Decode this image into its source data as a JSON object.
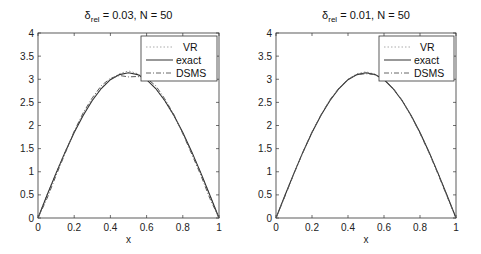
{
  "figure": {
    "panels": [
      {
        "title_symbol": "δ",
        "title_subscript": "rel",
        "title_rest": " = 0.03, N = 50",
        "xlabel": "x"
      },
      {
        "title_symbol": "δ",
        "title_subscript": "rel",
        "title_rest": " = 0.01, N = 50",
        "xlabel": "x"
      }
    ],
    "legend": [
      "VR",
      "exact",
      "DSMS"
    ]
  },
  "chart_data": [
    {
      "type": "line",
      "title": "δ_rel = 0.03, N = 50",
      "xlabel": "x",
      "ylabel": "",
      "xlim": [
        0,
        1
      ],
      "ylim": [
        0,
        4
      ],
      "xticks": [
        0,
        0.2,
        0.4,
        0.6,
        0.8,
        1
      ],
      "yticks": [
        0,
        0.5,
        1,
        1.5,
        2,
        2.5,
        3,
        3.5,
        4
      ],
      "legend_position": "upper right",
      "grid": false,
      "x": [
        0,
        0.05,
        0.1,
        0.15,
        0.2,
        0.25,
        0.3,
        0.35,
        0.4,
        0.45,
        0.5,
        0.55,
        0.6,
        0.65,
        0.7,
        0.75,
        0.8,
        0.85,
        0.9,
        0.95,
        1
      ],
      "series": [
        {
          "name": "VR",
          "style": "dotted",
          "values": [
            0,
            0.5,
            0.98,
            1.44,
            1.86,
            2.24,
            2.56,
            2.82,
            3.0,
            3.12,
            3.18,
            3.12,
            2.99,
            2.8,
            2.53,
            2.21,
            1.84,
            1.42,
            0.97,
            0.49,
            0
          ]
        },
        {
          "name": "exact",
          "style": "solid",
          "values": [
            0,
            0.49,
            0.97,
            1.43,
            1.85,
            2.22,
            2.54,
            2.8,
            2.99,
            3.1,
            3.14,
            3.1,
            2.99,
            2.8,
            2.54,
            2.22,
            1.85,
            1.43,
            0.97,
            0.49,
            0
          ]
        },
        {
          "name": "DSMS",
          "style": "dashdot",
          "values": [
            0,
            0.42,
            0.92,
            1.4,
            1.88,
            2.28,
            2.6,
            2.86,
            3.02,
            3.08,
            3.05,
            3.06,
            3.02,
            2.86,
            2.58,
            2.24,
            1.82,
            1.38,
            0.92,
            0.42,
            0
          ]
        }
      ]
    },
    {
      "type": "line",
      "title": "δ_rel = 0.01, N = 50",
      "xlabel": "x",
      "ylabel": "",
      "xlim": [
        0,
        1
      ],
      "ylim": [
        0,
        4
      ],
      "xticks": [
        0,
        0.2,
        0.4,
        0.6,
        0.8,
        1
      ],
      "yticks": [
        0,
        0.5,
        1,
        1.5,
        2,
        2.5,
        3,
        3.5,
        4
      ],
      "legend_position": "upper right",
      "grid": false,
      "x": [
        0,
        0.05,
        0.1,
        0.15,
        0.2,
        0.25,
        0.3,
        0.35,
        0.4,
        0.45,
        0.5,
        0.55,
        0.6,
        0.65,
        0.7,
        0.75,
        0.8,
        0.85,
        0.9,
        0.95,
        1
      ],
      "series": [
        {
          "name": "VR",
          "style": "dotted",
          "values": [
            0,
            0.49,
            0.97,
            1.43,
            1.85,
            2.22,
            2.54,
            2.8,
            3.0,
            3.12,
            3.16,
            3.11,
            2.99,
            2.8,
            2.54,
            2.22,
            1.85,
            1.43,
            0.97,
            0.49,
            0
          ]
        },
        {
          "name": "exact",
          "style": "solid",
          "values": [
            0,
            0.49,
            0.97,
            1.43,
            1.85,
            2.22,
            2.54,
            2.8,
            2.99,
            3.1,
            3.14,
            3.1,
            2.99,
            2.8,
            2.54,
            2.22,
            1.85,
            1.43,
            0.97,
            0.49,
            0
          ]
        },
        {
          "name": "DSMS",
          "style": "dashdot",
          "values": [
            0,
            0.47,
            0.96,
            1.42,
            1.86,
            2.23,
            2.56,
            2.81,
            3.0,
            3.1,
            3.12,
            3.1,
            3.0,
            2.81,
            2.55,
            2.21,
            1.83,
            1.41,
            0.95,
            0.47,
            0
          ]
        }
      ]
    }
  ]
}
